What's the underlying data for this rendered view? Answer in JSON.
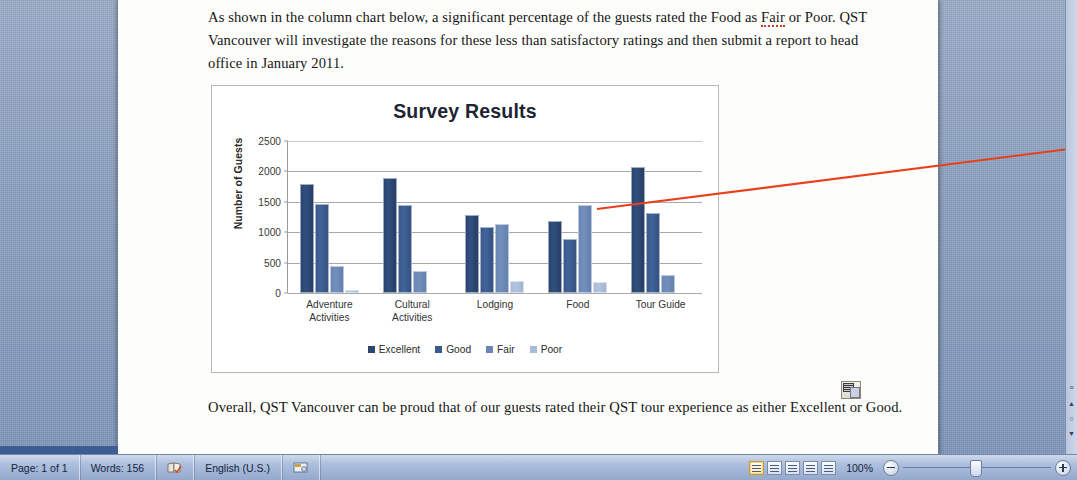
{
  "document": {
    "paragraph_top": "As shown in the column chart below, a significant percentage of the guests rated the Food as Fair or Poor. QST Vancouver will investigate the reasons for these less than satisfactory ratings and then submit a report to head office in January 2011.",
    "paragraph_bottom": "Overall, QST Vancouver can be proud that of our guests rated their QST tour experience as either Excellent or Good.",
    "misspelled_word": "Fair",
    "paste_options_icon": "paste-options-icon"
  },
  "chart_data": {
    "type": "bar",
    "title": "Survey Results",
    "xlabel": "",
    "ylabel": "Number of Guests",
    "ylim": [
      0,
      2500
    ],
    "yticks": [
      0,
      500,
      1000,
      1500,
      2000,
      2500
    ],
    "grid": true,
    "legend_position": "bottom",
    "categories": [
      "Adventure Activities",
      "Cultural Activities",
      "Lodging",
      "Food",
      "Tour Guide"
    ],
    "series": [
      {
        "name": "Excellent",
        "color": "#2c4470",
        "values": [
          1790,
          1890,
          1280,
          1190,
          2080
        ]
      },
      {
        "name": "Good",
        "color": "#3b5a8c",
        "values": [
          1470,
          1450,
          1080,
          890,
          1310
        ]
      },
      {
        "name": "Fair",
        "color": "#6b86b4",
        "values": [
          450,
          370,
          1130,
          1440,
          290
        ]
      },
      {
        "name": "Poor",
        "color": "#a8bbd8",
        "values": [
          50,
          20,
          200,
          180,
          20
        ]
      }
    ],
    "annotation": {
      "type": "callout-line",
      "color": "#e8401c",
      "from": "Food / Fair bar",
      "to": "right edge"
    }
  },
  "statusbar": {
    "page": "Page: 1 of 1",
    "words": "Words: 156",
    "proofing_icon": "spell-check-icon",
    "language": "English (U.S.)",
    "macro_icon": "record-macro-icon",
    "views": [
      {
        "name": "print-layout",
        "active": true
      },
      {
        "name": "full-screen-reading",
        "active": false
      },
      {
        "name": "web-layout",
        "active": false
      },
      {
        "name": "outline",
        "active": false
      },
      {
        "name": "draft",
        "active": false
      }
    ],
    "zoom_level": "100%",
    "zoom_out": "−",
    "zoom_in": "+"
  },
  "scrollbar": {
    "marks": [
      "≡",
      "▲",
      "○",
      "▼"
    ]
  }
}
